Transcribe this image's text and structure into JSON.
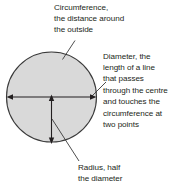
{
  "diagram": {
    "shape": "circle",
    "fill_color": "#d9d9d9",
    "stroke_color": "#3a3a3a",
    "text_color": "#231f20",
    "circle": {
      "center_x": 51.5,
      "center_y": 97,
      "radius": 45.5
    },
    "callouts": [
      {
        "id": "circumference",
        "lines": [
          "Circumference,",
          "the distance around",
          "the outside"
        ]
      },
      {
        "id": "diameter",
        "lines": [
          "Diameter, the",
          "length of a line",
          "that passes",
          "through the centre",
          "and touches the",
          "circumference at",
          "two points"
        ]
      },
      {
        "id": "radius",
        "lines": [
          "Radius, half",
          "the diameter"
        ]
      }
    ],
    "measures": [
      {
        "name": "diameter-arrow",
        "from_x": 7,
        "from_y": 97,
        "to_x": 96,
        "to_y": 97,
        "double_headed": true
      },
      {
        "name": "radius-arrow",
        "from_x": 51.5,
        "from_y": 97,
        "to_x": 51.5,
        "to_y": 142,
        "double_headed": true
      }
    ]
  }
}
